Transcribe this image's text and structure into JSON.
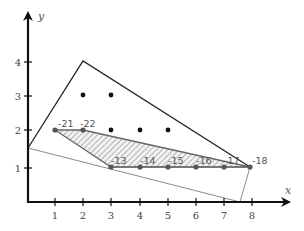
{
  "diagram": {
    "type": "integer-programming-feasible-region",
    "axes": {
      "x_label": "x",
      "y_label": "y",
      "x_ticks": [
        "1",
        "2",
        "3",
        "4",
        "5",
        "6",
        "7",
        "8"
      ],
      "y_ticks": [
        "1",
        "2",
        "3",
        "4"
      ]
    },
    "colors": {
      "axis": "#111111",
      "outer_polygon": "#222222",
      "inner_line": "#888888",
      "hatched_region": "#666666",
      "dots": "#111111",
      "labeled_points": "#555555"
    },
    "outer_polygon_vertices": [
      [
        0,
        1.55
      ],
      [
        2,
        4
      ],
      [
        7.95,
        1
      ]
    ],
    "thin_line_polygon_vertices": [
      [
        0,
        1.55
      ],
      [
        7.6,
        0
      ],
      [
        7.95,
        1
      ]
    ],
    "hatched_region_vertices": [
      [
        1,
        2
      ],
      [
        2,
        2
      ],
      [
        7.95,
        1
      ],
      [
        3,
        1
      ]
    ],
    "unlabeled_points": [
      [
        2,
        3
      ],
      [
        3,
        3
      ],
      [
        3,
        2
      ],
      [
        4,
        2
      ],
      [
        5,
        2
      ]
    ],
    "labeled_points": [
      {
        "x": 1,
        "y": 2,
        "label": "-21"
      },
      {
        "x": 2,
        "y": 2,
        "label": "-22"
      },
      {
        "x": 3,
        "y": 1,
        "label": "-13"
      },
      {
        "x": 4,
        "y": 1,
        "label": "-14"
      },
      {
        "x": 5,
        "y": 1,
        "label": "-15"
      },
      {
        "x": 6,
        "y": 1,
        "label": "-16"
      },
      {
        "x": 7,
        "y": 1,
        "label": "-17"
      },
      {
        "x": 7.95,
        "y": 1,
        "label": "-18"
      }
    ]
  }
}
